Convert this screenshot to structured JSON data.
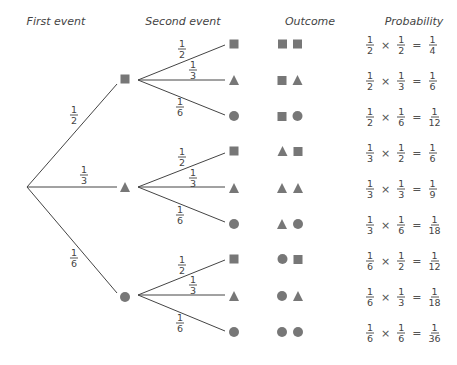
{
  "headers": {
    "first_event": "First event",
    "second_event": "Second event",
    "outcome": "Outcome",
    "probability": "Probability"
  },
  "shape_color": "#777777",
  "line_color": "#444444",
  "first_level": [
    {
      "shape": "square",
      "prob": {
        "num": "1",
        "den": "2"
      }
    },
    {
      "shape": "triangle",
      "prob": {
        "num": "1",
        "den": "3"
      }
    },
    {
      "shape": "circle",
      "prob": {
        "num": "1",
        "den": "6"
      }
    }
  ],
  "second_level_probs": [
    {
      "shape": "square",
      "num": "1",
      "den": "2"
    },
    {
      "shape": "triangle",
      "num": "1",
      "den": "3"
    },
    {
      "shape": "circle",
      "num": "1",
      "den": "6"
    }
  ],
  "rows": [
    {
      "outcome": [
        "square",
        "square"
      ],
      "a": {
        "num": "1",
        "den": "2"
      },
      "b": {
        "num": "1",
        "den": "2"
      },
      "r": {
        "num": "1",
        "den": "4"
      }
    },
    {
      "outcome": [
        "square",
        "triangle"
      ],
      "a": {
        "num": "1",
        "den": "2"
      },
      "b": {
        "num": "1",
        "den": "3"
      },
      "r": {
        "num": "1",
        "den": "6"
      }
    },
    {
      "outcome": [
        "square",
        "circle"
      ],
      "a": {
        "num": "1",
        "den": "2"
      },
      "b": {
        "num": "1",
        "den": "6"
      },
      "r": {
        "num": "1",
        "den": "12"
      }
    },
    {
      "outcome": [
        "triangle",
        "square"
      ],
      "a": {
        "num": "1",
        "den": "3"
      },
      "b": {
        "num": "1",
        "den": "2"
      },
      "r": {
        "num": "1",
        "den": "6"
      }
    },
    {
      "outcome": [
        "triangle",
        "triangle"
      ],
      "a": {
        "num": "1",
        "den": "3"
      },
      "b": {
        "num": "1",
        "den": "3"
      },
      "r": {
        "num": "1",
        "den": "9"
      }
    },
    {
      "outcome": [
        "triangle",
        "circle"
      ],
      "a": {
        "num": "1",
        "den": "3"
      },
      "b": {
        "num": "1",
        "den": "6"
      },
      "r": {
        "num": "1",
        "den": "18"
      }
    },
    {
      "outcome": [
        "circle",
        "square"
      ],
      "a": {
        "num": "1",
        "den": "6"
      },
      "b": {
        "num": "1",
        "den": "2"
      },
      "r": {
        "num": "1",
        "den": "12"
      }
    },
    {
      "outcome": [
        "circle",
        "triangle"
      ],
      "a": {
        "num": "1",
        "den": "6"
      },
      "b": {
        "num": "1",
        "den": "3"
      },
      "r": {
        "num": "1",
        "den": "18"
      }
    },
    {
      "outcome": [
        "circle",
        "circle"
      ],
      "a": {
        "num": "1",
        "den": "6"
      },
      "b": {
        "num": "1",
        "den": "6"
      },
      "r": {
        "num": "1",
        "den": "36"
      }
    }
  ],
  "operators": {
    "times": "×",
    "equals": "="
  }
}
